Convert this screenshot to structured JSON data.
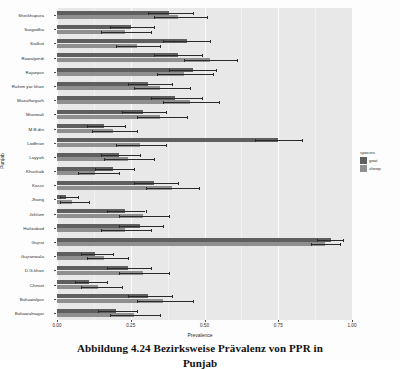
{
  "figure": {
    "caption_line1": "Abbildung 4.24 Bezirksweise Prävalenz von PPR in",
    "caption_line2": "Punjab"
  },
  "legend": {
    "title": "species",
    "items": [
      {
        "label": "goat",
        "color": "#5f5f5f"
      },
      {
        "label": "sheep",
        "color": "#8f8f8f"
      }
    ]
  },
  "chart_data": {
    "type": "bar",
    "orientation": "horizontal",
    "title": "",
    "xlabel": "Prevalence",
    "ylabel": "Punjab",
    "xlim": [
      0.0,
      1.0
    ],
    "xticks": [
      "0.00",
      "0.25",
      "0.50",
      "0.75",
      "1.00"
    ],
    "xtick_values": [
      0.0,
      0.25,
      0.5,
      0.75,
      1.0
    ],
    "grid": true,
    "legend_position": "right",
    "panel_background": "#e8e8e8",
    "categories": [
      "Sheikhupura",
      "Sargodha",
      "Sialkot",
      "Rawalpindi",
      "Rajanpur",
      "Rahim yar khan",
      "Muzaffargarh",
      "Mianwali",
      "M.B.din",
      "Lodhran",
      "Layyah",
      "Khushab",
      "Kasur",
      "Jhang",
      "Jehlum",
      "Hafizabad",
      "Gujrat",
      "Gujranwala",
      "D.G.khan",
      "Chiniot",
      "Bahawalpur",
      "Bahawalnagar"
    ],
    "series": [
      {
        "name": "goat",
        "color": "#5f5f5f",
        "values": [
          0.38,
          0.25,
          0.44,
          0.41,
          0.46,
          0.31,
          0.4,
          0.29,
          0.16,
          0.75,
          0.21,
          0.19,
          0.33,
          0.03,
          0.23,
          0.28,
          0.93,
          0.13,
          0.24,
          0.11,
          0.31,
          0.2
        ],
        "err_low": [
          0.31,
          0.18,
          0.36,
          0.33,
          0.38,
          0.24,
          0.32,
          0.22,
          0.1,
          0.67,
          0.15,
          0.13,
          0.26,
          0.01,
          0.17,
          0.21,
          0.88,
          0.08,
          0.17,
          0.06,
          0.24,
          0.14
        ],
        "err_high": [
          0.46,
          0.33,
          0.52,
          0.49,
          0.54,
          0.39,
          0.49,
          0.37,
          0.23,
          0.83,
          0.28,
          0.26,
          0.41,
          0.07,
          0.3,
          0.36,
          0.97,
          0.19,
          0.32,
          0.17,
          0.39,
          0.27
        ]
      },
      {
        "name": "sheep",
        "color": "#8f8f8f",
        "values": [
          0.41,
          0.23,
          0.27,
          0.52,
          0.43,
          0.35,
          0.45,
          0.35,
          0.19,
          0.28,
          0.24,
          0.13,
          0.39,
          0.05,
          0.29,
          0.23,
          0.91,
          0.16,
          0.29,
          0.14,
          0.36,
          0.26
        ],
        "err_low": [
          0.33,
          0.15,
          0.2,
          0.43,
          0.34,
          0.26,
          0.36,
          0.27,
          0.12,
          0.2,
          0.16,
          0.07,
          0.3,
          0.01,
          0.21,
          0.15,
          0.86,
          0.1,
          0.21,
          0.08,
          0.27,
          0.18
        ],
        "err_high": [
          0.51,
          0.32,
          0.35,
          0.61,
          0.53,
          0.45,
          0.55,
          0.44,
          0.27,
          0.37,
          0.33,
          0.21,
          0.48,
          0.11,
          0.38,
          0.32,
          0.96,
          0.24,
          0.38,
          0.22,
          0.46,
          0.35
        ]
      }
    ]
  }
}
